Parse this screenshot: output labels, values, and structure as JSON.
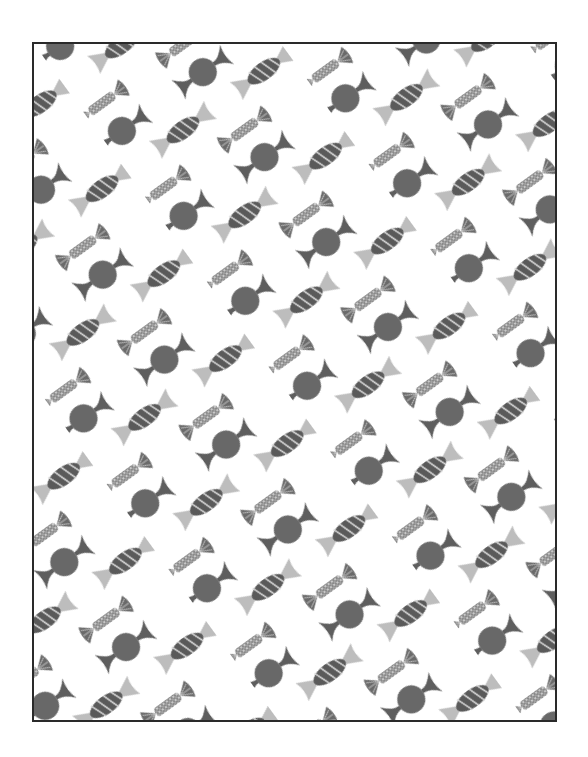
{
  "image": {
    "description": "Wrapping paper pattern of wrapped candies in diagonal rows, grayscale",
    "caption": "Candy wrapper pattern"
  },
  "pattern": {
    "rotation_deg": -36,
    "colors": {
      "background": "#ffffff",
      "frame": "#2a2a2a",
      "dark": "#5a5a5a",
      "medium": "#7a7a7a",
      "light": "#bdbdbd",
      "stripe": "#d8d8d8"
    },
    "candy_types": [
      "round-candy",
      "striped-candy",
      "speckled-candy"
    ]
  }
}
